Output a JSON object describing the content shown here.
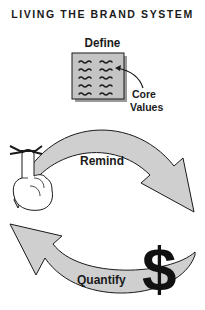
{
  "title": "LIVING THE BRAND SYSTEM",
  "diagram": {
    "type": "cycle",
    "define": {
      "label": "Define",
      "document_icon": "document-with-wavy-lines",
      "callout": {
        "line1": "Core",
        "line2": "Values"
      }
    },
    "remind": {
      "label": "Remind",
      "icon": "finger-with-string-icon",
      "direction": "left-to-right"
    },
    "quantify": {
      "label": "Quantify",
      "icon": "dollar-sign-icon",
      "icon_glyph": "$",
      "direction": "right-to-left"
    }
  },
  "colors": {
    "arrow_fill": "#cfcfcf",
    "outline": "#1a1a1a",
    "document_fill": "#c4c4c4",
    "background": "#ffffff"
  }
}
